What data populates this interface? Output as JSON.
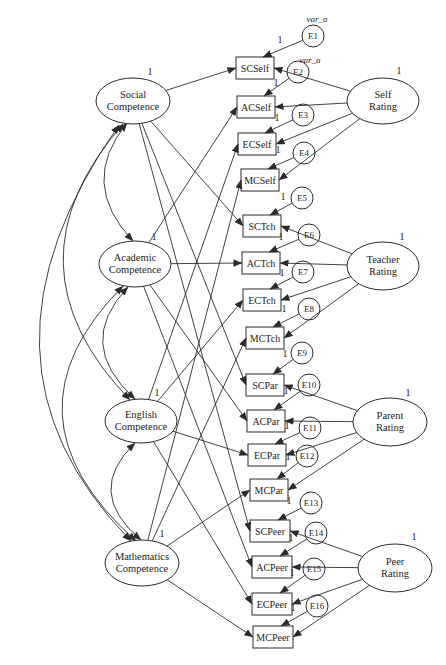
{
  "diagram_type": "structural-equation-model-path-diagram",
  "constants": {
    "one": "1"
  },
  "trait_factors": [
    {
      "id": "social",
      "line1": "Social",
      "line2": "Competence",
      "variance": "1"
    },
    {
      "id": "academic",
      "line1": "Academic",
      "line2": "Competence",
      "variance": "1"
    },
    {
      "id": "english",
      "line1": "English",
      "line2": "Competence",
      "variance": "1"
    },
    {
      "id": "mathematics",
      "line1": "Mathematics",
      "line2": "Competence",
      "variance": "1"
    }
  ],
  "method_factors": [
    {
      "id": "self",
      "line1": "Self",
      "line2": "Rating",
      "variance": "1"
    },
    {
      "id": "teacher",
      "line1": "Teacher",
      "line2": "Rating",
      "variance": "1"
    },
    {
      "id": "parent",
      "line1": "Parent",
      "line2": "Rating",
      "variance": "1"
    },
    {
      "id": "peer",
      "line1": "Peer",
      "line2": "Rating",
      "variance": "1"
    }
  ],
  "indicators": [
    {
      "label": "SCSelf",
      "trait": "social",
      "method": "self",
      "error": "E1"
    },
    {
      "label": "ACSelf",
      "trait": "academic",
      "method": "self",
      "error": "E2"
    },
    {
      "label": "ECSelf",
      "trait": "english",
      "method": "self",
      "error": "E3"
    },
    {
      "label": "MCSelf",
      "trait": "mathematics",
      "method": "self",
      "error": "E4"
    },
    {
      "label": "SCTch",
      "trait": "social",
      "method": "teacher",
      "error": "E5"
    },
    {
      "label": "ACTch",
      "trait": "academic",
      "method": "teacher",
      "error": "E6"
    },
    {
      "label": "ECTch",
      "trait": "english",
      "method": "teacher",
      "error": "E7"
    },
    {
      "label": "MCTch",
      "trait": "mathematics",
      "method": "teacher",
      "error": "E8"
    },
    {
      "label": "SCPar",
      "trait": "social",
      "method": "parent",
      "error": "E9"
    },
    {
      "label": "ACPar",
      "trait": "academic",
      "method": "parent",
      "error": "E10"
    },
    {
      "label": "ECPar",
      "trait": "english",
      "method": "parent",
      "error": "E11"
    },
    {
      "label": "MCPar",
      "trait": "mathematics",
      "method": "parent",
      "error": "E12"
    },
    {
      "label": "SCPeer",
      "trait": "social",
      "method": "peer",
      "error": "E13"
    },
    {
      "label": "ACPeer",
      "trait": "academic",
      "method": "peer",
      "error": "E14"
    },
    {
      "label": "ECPeer",
      "trait": "english",
      "method": "peer",
      "error": "E15"
    },
    {
      "label": "MCPeer",
      "trait": "mathematics",
      "method": "peer",
      "error": "E16"
    }
  ],
  "errors": [
    {
      "label": "E1",
      "loading": "1",
      "variance_label": "var_a"
    },
    {
      "label": "E2",
      "loading": "1",
      "variance_label": "var_a"
    },
    {
      "label": "E3",
      "loading": "1"
    },
    {
      "label": "E4",
      "loading": "1"
    },
    {
      "label": "E5",
      "loading": "1"
    },
    {
      "label": "E6",
      "loading": "1"
    },
    {
      "label": "E7",
      "loading": "1"
    },
    {
      "label": "E8",
      "loading": "1"
    },
    {
      "label": "E9",
      "loading": "1"
    },
    {
      "label": "E10",
      "loading": "1"
    },
    {
      "label": "E11",
      "loading": "1"
    },
    {
      "label": "E12",
      "loading": "1"
    },
    {
      "label": "E13",
      "loading": "1"
    },
    {
      "label": "E14",
      "loading": "1"
    },
    {
      "label": "E15",
      "loading": "1"
    },
    {
      "label": "E16",
      "loading": "1"
    }
  ],
  "trait_covariances": [
    [
      "social",
      "academic"
    ],
    [
      "social",
      "english"
    ],
    [
      "social",
      "mathematics"
    ],
    [
      "academic",
      "english"
    ],
    [
      "academic",
      "mathematics"
    ],
    [
      "english",
      "mathematics"
    ]
  ]
}
